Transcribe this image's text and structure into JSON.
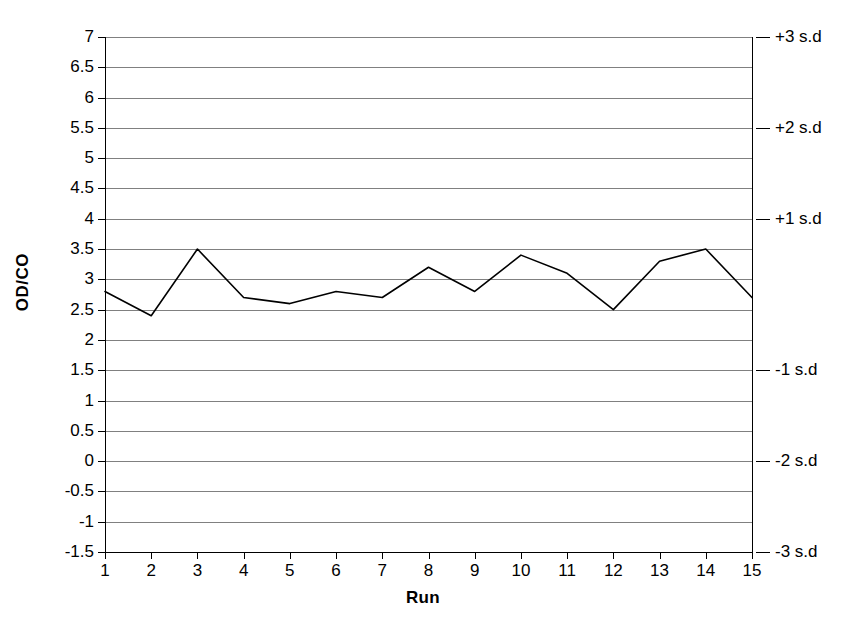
{
  "chart_data": {
    "type": "line",
    "title": "",
    "xlabel": "Run",
    "ylabel": "OD/CO",
    "categories": [
      1,
      2,
      3,
      4,
      5,
      6,
      7,
      8,
      9,
      10,
      11,
      12,
      13,
      14,
      15
    ],
    "x": [
      1,
      2,
      3,
      4,
      5,
      6,
      7,
      8,
      9,
      10,
      11,
      12,
      13,
      14,
      15
    ],
    "values": [
      2.8,
      2.4,
      3.5,
      2.7,
      2.6,
      2.8,
      2.7,
      3.2,
      2.8,
      3.4,
      3.1,
      2.5,
      3.3,
      3.5,
      2.7
    ],
    "series": [
      {
        "name": "OD/CO",
        "values": [
          2.8,
          2.4,
          3.5,
          2.7,
          2.6,
          2.8,
          2.7,
          3.2,
          2.8,
          3.4,
          3.1,
          2.5,
          3.3,
          3.5,
          2.7
        ],
        "color": "#000000"
      }
    ],
    "ylim": [
      -1.5,
      7
    ],
    "xlim": [
      1,
      15
    ],
    "ytick_labels": [
      "7",
      "6.5",
      "6",
      "5.5",
      "5",
      "4.5",
      "4",
      "3.5",
      "3",
      "2.5",
      "2",
      "1.5",
      "1",
      "0.5",
      "0",
      "-0.5",
      "-1",
      "-1.5"
    ],
    "ytick_values": [
      7,
      6.5,
      6,
      5.5,
      5,
      4.5,
      4,
      3.5,
      3,
      2.5,
      2,
      1.5,
      1,
      0.5,
      0,
      -0.5,
      -1,
      -1.5
    ],
    "xtick_labels": [
      "1",
      "2",
      "3",
      "4",
      "5",
      "6",
      "7",
      "8",
      "9",
      "10",
      "11",
      "12",
      "13",
      "14",
      "15"
    ],
    "grid": true,
    "grid_color": "#808080",
    "legend": "none",
    "secondary_axis": {
      "position": "right",
      "ticks": [
        {
          "label": "+3 s.d",
          "value": 7
        },
        {
          "label": "+2 s.d",
          "value": 5.5
        },
        {
          "label": "+1 s.d",
          "value": 4
        },
        {
          "label": "-1 s.d",
          "value": 1.5
        },
        {
          "label": "-2 s.d",
          "value": 0
        },
        {
          "label": "-3 s.d",
          "value": -1.5
        }
      ]
    }
  }
}
